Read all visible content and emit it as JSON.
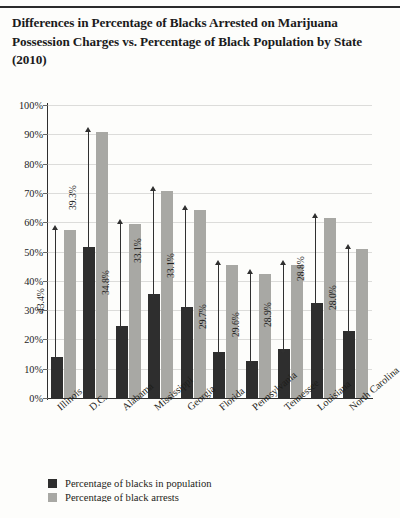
{
  "title": "Differences in Percentage of Blacks Arrested on Marijuana Possession Charges vs. Percentage of Black Population by State (2010)",
  "colors": {
    "population_bar": "#2e2e2e",
    "arrest_bar": "#a8a8a4",
    "gridline": "#dcdcda",
    "axis": "#2f2f2f",
    "page_background": "#fdfdfb"
  },
  "legend": {
    "items": [
      {
        "label": "Percentage of blacks in population",
        "swatch": "#2e2e2e"
      },
      {
        "label": "Percentage of black arrests",
        "swatch": "#a8a8a4"
      }
    ]
  },
  "chart_data": {
    "type": "bar",
    "title": "Differences in Percentage of Blacks Arrested on Marijuana Possession Charges vs. Percentage of Black Population by State (2010)",
    "xlabel": "",
    "ylabel": "",
    "ylim": [
      0,
      100
    ],
    "ytick_labels": [
      "100%",
      "90%",
      "80%",
      "70%",
      "60%",
      "50%",
      "40%",
      "30%",
      "20%",
      "10%",
      "0%"
    ],
    "ytick_values": [
      100,
      90,
      80,
      70,
      60,
      50,
      40,
      30,
      20,
      10,
      0
    ],
    "grid": true,
    "legend_position": "bottom-left",
    "categories": [
      "Illinois",
      "D.C.",
      "Alabama",
      "Mississippi",
      "Georgia",
      "Florida",
      "Pennsylvania",
      "Tennessee",
      "Louisiana",
      "North Carolina"
    ],
    "series": [
      {
        "name": "Percentage of blacks in population",
        "values": [
          14.0,
          51.5,
          24.5,
          35.4,
          31.2,
          15.6,
          12.8,
          16.6,
          32.5,
          23.0
        ]
      },
      {
        "name": "Percentage of black arrests",
        "values": [
          57.4,
          90.8,
          59.3,
          70.5,
          64.3,
          45.3,
          42.4,
          45.5,
          61.3,
          51.0
        ]
      }
    ],
    "difference_labels": [
      "43.4%",
      "39.3%",
      "34.8%",
      "33.1%",
      "33.1%",
      "29.7%",
      "29.6%",
      "28.9%",
      "28.8%",
      "28.0%"
    ]
  }
}
